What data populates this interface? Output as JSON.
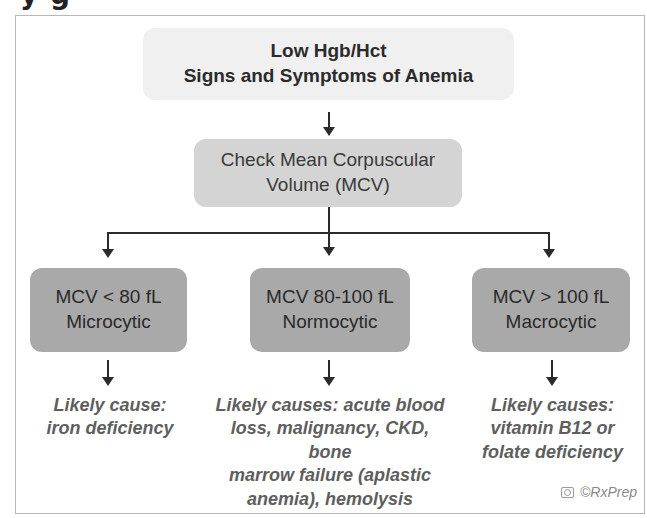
{
  "heading_fragment": "y g",
  "flowchart": {
    "start": {
      "line1": "Low Hgb/Hct",
      "line2": "Signs and Symptoms of Anemia"
    },
    "step": {
      "line1": "Check Mean Corpuscular",
      "line2": "Volume (MCV)"
    },
    "categories": [
      {
        "range": "MCV < 80 fL",
        "type": "Microcytic",
        "cause_lines": [
          "Likely cause:",
          "iron deficiency"
        ]
      },
      {
        "range": "MCV 80-100 fL",
        "type": "Normocytic",
        "cause_lines": [
          "Likely causes: acute blood",
          "loss, malignancy, CKD, bone",
          "marrow failure (aplastic",
          "anemia), hemolysis"
        ]
      },
      {
        "range": "MCV > 100 fL",
        "type": "Macrocytic",
        "cause_lines": [
          "Likely causes:",
          "vitamin B12 or",
          "folate deficiency"
        ]
      }
    ]
  },
  "watermark": {
    "icon": "camera-icon",
    "text": "©RxPrep"
  },
  "colors": {
    "start_box": "#f0f0f0",
    "step_box": "#d4d4d4",
    "category_box": "#a9a9a9",
    "cause_text": "#5e5e5e",
    "connector": "#2b2b2b"
  }
}
